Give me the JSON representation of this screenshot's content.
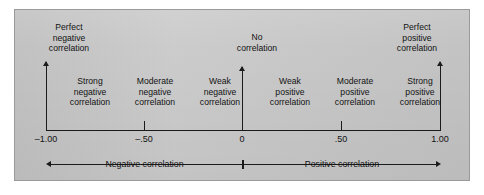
{
  "figure": {
    "panel_background": "#c9c9c9",
    "panel_border": "#9a9a9a",
    "ink_color": "#1b1b1b",
    "page_background": "#ffffff"
  },
  "endpoints": {
    "perfect_negative": {
      "line1": "Perfect",
      "line2": "negative",
      "line3": "correlation"
    },
    "no_correlation": {
      "line1": "No",
      "line2": "correlation"
    },
    "perfect_positive": {
      "line1": "Perfect",
      "line2": "positive",
      "line3": "correlation"
    }
  },
  "bands": [
    {
      "id": "strong-negative",
      "line1": "Strong",
      "line2": "negative",
      "line3": "correlation"
    },
    {
      "id": "moderate-negative",
      "line1": "Moderate",
      "line2": "negative",
      "line3": "correlation"
    },
    {
      "id": "weak-negative",
      "line1": "Weak",
      "line2": "negative",
      "line3": "correlation"
    },
    {
      "id": "weak-positive",
      "line1": "Weak",
      "line2": "positive",
      "line3": "correlation"
    },
    {
      "id": "moderate-positive",
      "line1": "Moderate",
      "line2": "positive",
      "line3": "correlation"
    },
    {
      "id": "strong-positive",
      "line1": "Strong",
      "line2": "positive",
      "line3": "correlation"
    }
  ],
  "axis": {
    "ticks": [
      {
        "id": "neg-one",
        "label": "–1.00",
        "value": -1.0
      },
      {
        "id": "neg-half",
        "label": "–.50",
        "value": -0.5
      },
      {
        "id": "zero",
        "label": "0",
        "value": 0.0
      },
      {
        "id": "pos-half",
        "label": ".50",
        "value": 0.5
      },
      {
        "id": "pos-one",
        "label": "1.00",
        "value": 1.0
      }
    ]
  },
  "summary": {
    "negative": "Negative correlation",
    "positive": "Positive correlation"
  },
  "chart_data": {
    "type": "scale",
    "title": "",
    "xlabel": "Correlation coefficient (r)",
    "ylabel": "",
    "xlim": [
      -1.0,
      1.0
    ],
    "grid": false,
    "legend": "none",
    "tick_values": [
      -1.0,
      -0.5,
      0.0,
      0.5,
      1.0
    ],
    "tick_labels": [
      "–1.00",
      "–.50",
      "0",
      ".50",
      "1.00"
    ],
    "annotations": [
      {
        "at": -1.0,
        "text": "Perfect negative correlation",
        "pointer": "up-arrow"
      },
      {
        "at": 0.0,
        "text": "No correlation",
        "pointer": "up-arrow"
      },
      {
        "at": 1.0,
        "text": "Perfect positive correlation",
        "pointer": "up-arrow"
      }
    ],
    "segments": [
      {
        "label": "Strong negative correlation",
        "range": [
          -1.0,
          -0.66
        ]
      },
      {
        "label": "Moderate negative correlation",
        "range": [
          -0.66,
          -0.33
        ]
      },
      {
        "label": "Weak negative correlation",
        "range": [
          -0.33,
          0.0
        ]
      },
      {
        "label": "Weak positive correlation",
        "range": [
          0.0,
          0.33
        ]
      },
      {
        "label": "Moderate positive correlation",
        "range": [
          0.33,
          0.66
        ]
      },
      {
        "label": "Strong positive correlation",
        "range": [
          0.66,
          1.0
        ]
      }
    ],
    "spans": [
      {
        "label": "Negative correlation",
        "range": [
          -1.0,
          0.0
        ],
        "arrow": "left"
      },
      {
        "label": "Positive correlation",
        "range": [
          0.0,
          1.0
        ],
        "arrow": "right"
      }
    ]
  }
}
